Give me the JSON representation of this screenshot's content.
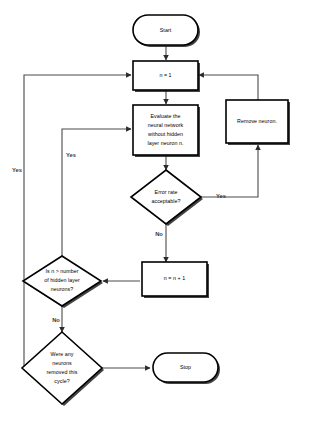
{
  "diagram": {
    "background_color": "#ffffff",
    "line_color": "#4a4a4a",
    "shape_fill": "#ffffff",
    "shape_stroke": "#000000",
    "shadow_color": "#1a1a1a"
  },
  "nodes": {
    "start": {
      "label": "Start",
      "shape": "terminator"
    },
    "init": {
      "label": "n = 1",
      "shape": "process"
    },
    "evaluate": {
      "line1": "Evaluate the",
      "line2": "neural network",
      "line3": "without hidden",
      "line4": "layer neuron n.",
      "shape": "process"
    },
    "error_rate": {
      "line1": "Error rate",
      "line2": "acceptable?",
      "shape": "decision"
    },
    "remove": {
      "label": "Remove neuron.",
      "shape": "process"
    },
    "increment": {
      "label": "n = n + 1",
      "shape": "process"
    },
    "check_count": {
      "line1": "Is n > number",
      "line2": "of hidden layer",
      "line3": "neurons?",
      "shape": "decision"
    },
    "any_removed": {
      "line1": "Were any",
      "line2": "neurons",
      "line3": "removed this",
      "line4": "cycle?",
      "shape": "decision"
    },
    "stop": {
      "label": "Stop",
      "shape": "terminator"
    }
  },
  "edge_labels": {
    "error_rate_yes": "Yes",
    "error_rate_no": "No",
    "check_count_yes": "Yes",
    "check_count_no": "No",
    "any_removed_yes": "Yes"
  }
}
